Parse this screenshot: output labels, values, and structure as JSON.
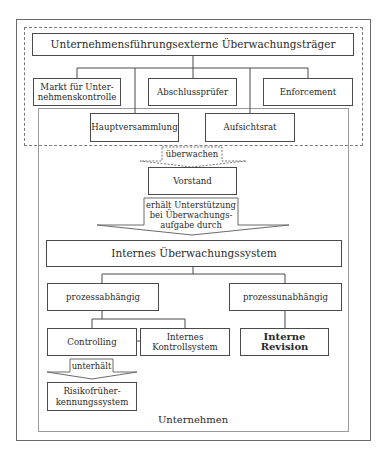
{
  "diagram": {
    "external": {
      "title": "Unternehmensführungsexterne Überwachungsträger",
      "nodes": [
        {
          "id": "markt",
          "label": "Markt für Unter-\nnehmenskontrolle"
        },
        {
          "id": "abschlusspruefer",
          "label": "Abschlussprüfer"
        },
        {
          "id": "enforcement",
          "label": "Enforcement"
        },
        {
          "id": "hauptversammlung",
          "label": "Hauptversammlung"
        },
        {
          "id": "aufsichtsrat",
          "label": "Aufsichtsrat"
        }
      ]
    },
    "arrows": {
      "ueberwachen": "überwachen",
      "unterstuetzung": "erhält Unterstützung bei Überwachungs-aufgabe durch",
      "unterstuetzung_lines": [
        "erhält Unterstützung",
        "bei Überwachungs-",
        "aufgabe durch"
      ],
      "unterhaelt": "unterhält"
    },
    "vorstand": "Vorstand",
    "internal": {
      "title": "Internes Überwachungssystem",
      "process_dependent": "prozessabhängig",
      "process_independent": "prozessunabhängig",
      "controlling": "Controlling",
      "iks_lines": [
        "Internes",
        "Kontrollsystem"
      ],
      "interne_revision": "Interne Revision",
      "risk_lines": [
        "Risikofrüher-",
        "kennungssystem"
      ]
    },
    "markt_lines": [
      "Markt für Unter-",
      "nehmenskontrolle"
    ],
    "company_label": "Unternehmen"
  }
}
